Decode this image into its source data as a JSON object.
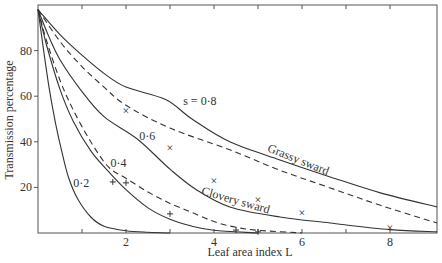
{
  "chart_data": {
    "type": "line",
    "title": "",
    "xlabel": "Leaf area index L",
    "ylabel": "Transmission percentage",
    "xlim": [
      0,
      9.07
    ],
    "ylim": [
      0,
      100
    ],
    "x_ticks": [
      2,
      4,
      6,
      8
    ],
    "x_minor_ticks": [
      1,
      3,
      5,
      7
    ],
    "y_ticks": [
      20,
      40,
      60,
      80
    ],
    "grid": false,
    "series": [
      {
        "name": "s = 0·8",
        "style": "solid",
        "x": [
          0,
          0.5,
          1,
          1.5,
          2,
          2.9,
          3.5,
          4.36,
          5.5,
          6.64,
          7.8,
          9.07
        ],
        "y": [
          98,
          87,
          78,
          70,
          64,
          58.5,
          50,
          40,
          32,
          24.6,
          17.5,
          11.4
        ]
      },
      {
        "name": "Grassy sward",
        "style": "dashed",
        "x": [
          0,
          0.5,
          1,
          1.5,
          2,
          3,
          4.36,
          5.5,
          6.64,
          7.8,
          9.07
        ],
        "y": [
          98,
          84,
          73,
          64,
          56,
          46,
          36.5,
          27.5,
          19.8,
          12,
          4.4
        ]
      },
      {
        "name": "0·6",
        "style": "solid",
        "x": [
          0,
          0.25,
          0.5,
          1,
          1.5,
          2.27,
          3,
          3.6,
          4.36,
          5.5,
          6.64,
          8,
          9.07
        ],
        "y": [
          98,
          86,
          76,
          62,
          51,
          41,
          28,
          19,
          11.4,
          7,
          4.4,
          1.5,
          0.5
        ]
      },
      {
        "name": "0·4",
        "style": "solid",
        "x": [
          0,
          0.2,
          0.5,
          0.8,
          1.2,
          1.6,
          2,
          2.5,
          3,
          3.5,
          4,
          5
        ],
        "y": [
          98,
          82,
          63,
          49,
          36,
          27,
          19,
          11,
          6,
          3,
          1.2,
          0
        ]
      },
      {
        "name": "Clovery sward",
        "style": "dashed",
        "x": [
          0,
          0.2,
          0.5,
          0.8,
          1.2,
          1.6,
          2,
          2.5,
          3,
          3.5,
          4,
          4.5,
          5,
          6
        ],
        "y": [
          98,
          84,
          67,
          54,
          40,
          29,
          24,
          18,
          13,
          9,
          5,
          2.5,
          1.2,
          0
        ]
      },
      {
        "name": "0·2",
        "style": "solid",
        "x": [
          0,
          0.1,
          0.25,
          0.4,
          0.55,
          0.7,
          0.9,
          1.2,
          1.5,
          2,
          2.5,
          3
        ],
        "y": [
          98,
          84,
          64,
          48,
          35,
          24,
          15,
          7,
          3,
          1,
          0.3,
          0
        ]
      }
    ],
    "markers": {
      "grassy_x": {
        "symbol": "x",
        "x": [
          2,
          3,
          4,
          5,
          6,
          8
        ],
        "y": [
          53.6,
          37.4,
          22.9,
          14.5,
          8.8,
          2.2
        ]
      },
      "clovery_plus": {
        "symbol": "+",
        "x": [
          1.7,
          2,
          3,
          4.5,
          5
        ],
        "y": [
          22.4,
          22,
          8.4,
          1.3,
          0.5
        ]
      }
    },
    "annotations": [
      {
        "text": "s = 0·8",
        "x": 3.3,
        "y": 56
      },
      {
        "text": "0·6",
        "x": 2.3,
        "y": 41
      },
      {
        "text": "0·4",
        "x": 1.65,
        "y": 29
      },
      {
        "text": "0·2",
        "x": 0.8,
        "y": 20
      },
      {
        "text": "Grassy sward",
        "x": 5.2,
        "y": 36,
        "rotation": 22
      },
      {
        "text": "Clovery sward",
        "x": 3.7,
        "y": 17,
        "rotation": 16
      }
    ]
  }
}
